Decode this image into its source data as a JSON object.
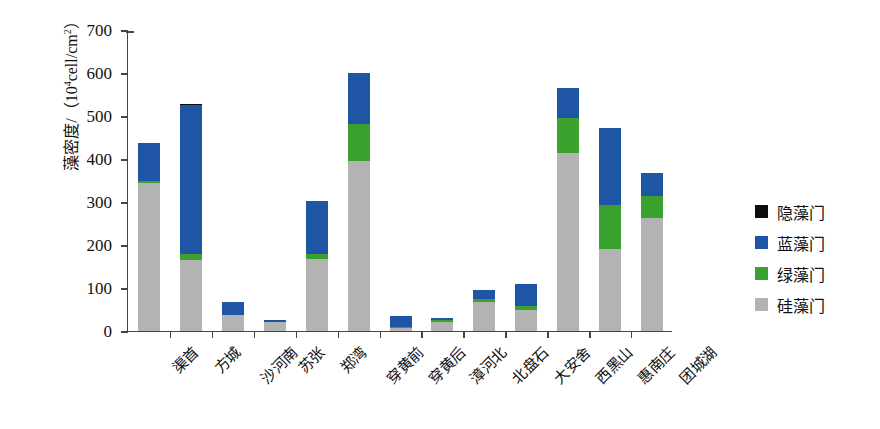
{
  "chart_data": {
    "type": "bar",
    "stacked": true,
    "title": "",
    "xlabel": "",
    "ylabel": "藻密度/（10⁴cell/cm²）",
    "ylabel_main": "藻密度/（10",
    "ylabel_sup": "4",
    "ylabel_tail": "cell/cm",
    "ylabel_sup2": "2",
    "ylabel_end": "）",
    "ylim": [
      0,
      700
    ],
    "yticks": [
      0,
      100,
      200,
      300,
      400,
      500,
      600,
      700
    ],
    "ytick_labels": [
      "0",
      "100",
      "200",
      "300",
      "400",
      "500",
      "600",
      "700"
    ],
    "grid": false,
    "legend_position": "right",
    "categories": [
      "渠首",
      "方城",
      "沙河南",
      "苏张",
      "郑湾",
      "穿黄前",
      "穿黄后",
      "漳河北",
      "北盘石",
      "大安舍",
      "西黑山",
      "惠南庄",
      "团城湖"
    ],
    "series": [
      {
        "name": "硅藻门",
        "color": "#b3b3b3",
        "values": [
          345,
          165,
          38,
          20,
          168,
          396,
          8,
          22,
          68,
          50,
          413,
          190,
          262
        ]
      },
      {
        "name": "绿藻门",
        "color": "#3aa12e",
        "values": [
          5,
          15,
          0,
          2,
          12,
          86,
          2,
          4,
          7,
          8,
          82,
          103,
          51
        ]
      },
      {
        "name": "蓝藻门",
        "color": "#1f55a5",
        "values": [
          87,
          345,
          30,
          3,
          122,
          118,
          25,
          4,
          20,
          52,
          70,
          179,
          54
        ]
      },
      {
        "name": "隐藻门",
        "color": "#0d0d0d",
        "values": [
          0,
          3,
          0,
          0,
          0,
          0,
          0,
          0,
          0,
          0,
          0,
          0,
          0
        ]
      }
    ],
    "totals": [
      437,
      528,
      68,
      25,
      302,
      600,
      35,
      30,
      95,
      110,
      565,
      472,
      367
    ],
    "legend": [
      {
        "label": "隐藻门",
        "color": "#0d0d0d"
      },
      {
        "label": "蓝藻门",
        "color": "#1f55a5"
      },
      {
        "label": "绿藻门",
        "color": "#3aa12e"
      },
      {
        "label": "硅藻门",
        "color": "#b3b3b3"
      }
    ]
  }
}
